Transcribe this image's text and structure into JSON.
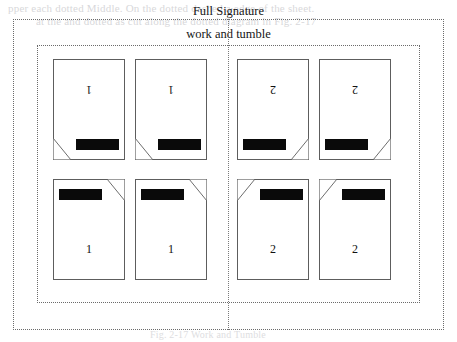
{
  "sheet": {
    "title": "Full Signature",
    "signature_label": "work and tumble"
  },
  "ghost_text": {
    "line1": "pper each dotted Middle. On the dotted dashed a edge of the sheet.",
    "line2": "at the and dotted as  cut along the dotted diagram in Fig. 2-17",
    "line3": "Fig. 2-17  Work and Tumble"
  },
  "colors": {
    "content_bar": "#0a0a0a",
    "page_outline": "#5d5d5d",
    "guide_dotted": "#6b6b6b",
    "fold_line": "#7a7a7a",
    "ghost": "#b9b9bd",
    "paper": "#ffffff"
  },
  "layout": {
    "rows": 2,
    "columns": 4,
    "total_pages": 8,
    "fold_axis": "vertical-center",
    "imposition_type": "work and tumble"
  },
  "pages": [
    {
      "number": "1",
      "orientation": "inverted",
      "row": "top",
      "column": "col-a",
      "bar_position": "bottom-right",
      "dogear_position": "bottom-left",
      "label_name": "page-1-top-left"
    },
    {
      "number": "1",
      "orientation": "inverted",
      "row": "top",
      "column": "col-b",
      "bar_position": "bottom-right",
      "dogear_position": "bottom-left",
      "label_name": "page-1-top-left-2"
    },
    {
      "number": "2",
      "orientation": "inverted",
      "row": "top",
      "column": "col-c",
      "bar_position": "bottom-left",
      "dogear_position": "bottom-right",
      "label_name": "page-2-top-right"
    },
    {
      "number": "2",
      "orientation": "inverted",
      "row": "top",
      "column": "col-d",
      "bar_position": "bottom-left",
      "dogear_position": "bottom-right",
      "label_name": "page-2-top-right-2"
    },
    {
      "number": "1",
      "orientation": "upright",
      "row": "bottom",
      "column": "col-a",
      "bar_position": "top-left",
      "dogear_position": "top-right",
      "label_name": "page-1-bottom-left"
    },
    {
      "number": "1",
      "orientation": "upright",
      "row": "bottom",
      "column": "col-b",
      "bar_position": "top-left",
      "dogear_position": "top-right",
      "label_name": "page-1-bottom-left-2"
    },
    {
      "number": "2",
      "orientation": "upright",
      "row": "bottom",
      "column": "col-c",
      "bar_position": "top-right",
      "dogear_position": "top-left",
      "label_name": "page-2-bottom-right"
    },
    {
      "number": "2",
      "orientation": "upright",
      "row": "bottom",
      "column": "col-d",
      "bar_position": "top-right",
      "dogear_position": "top-left",
      "label_name": "page-2-bottom-right-2"
    }
  ]
}
